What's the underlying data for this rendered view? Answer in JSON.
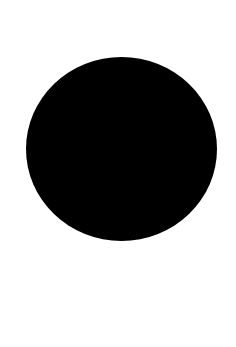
{
  "canvas": {
    "width": 236,
    "height": 347,
    "background_color": "#ffffff"
  },
  "shape": {
    "type": "filled-circle",
    "fill_color": "#000000",
    "bounds": {
      "left": 26,
      "top": 57,
      "width": 191,
      "height": 184
    }
  }
}
